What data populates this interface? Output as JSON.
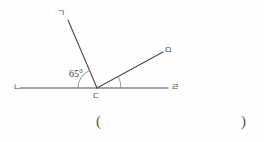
{
  "figure": {
    "background_color": "#fefefe",
    "stroke_color": "#4a4a4a",
    "arc_color": "#7a7a7a",
    "points": {
      "g": {
        "label": "ㄱ",
        "name": "point-g",
        "x": 68,
        "y": 20
      },
      "n": {
        "label": "ㄴ",
        "name": "point-n",
        "x": 20,
        "y": 88
      },
      "d": {
        "label": "ㄷ",
        "name": "point-d",
        "x": 97,
        "y": 88
      },
      "m": {
        "label": "ㅁ",
        "name": "point-m",
        "x": 163,
        "y": 52
      },
      "r": {
        "label": "ㄹ",
        "name": "point-r",
        "x": 168,
        "y": 88
      }
    },
    "segments": [
      {
        "name": "line-n-r",
        "from": "n",
        "to": "r"
      },
      {
        "name": "ray-d-g",
        "from": "d",
        "to": "g"
      },
      {
        "name": "ray-d-m",
        "from": "d",
        "to": "m"
      }
    ],
    "angles": [
      {
        "name": "angle-n-d-g",
        "value": "65°",
        "radius": 19
      },
      {
        "name": "angle-m-d-r",
        "value": "",
        "radius": 24
      }
    ]
  },
  "answer_field": {
    "open_paren": "(",
    "close_paren": ")",
    "value": ""
  }
}
